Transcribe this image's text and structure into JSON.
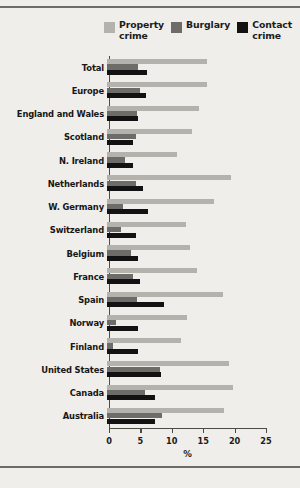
{
  "chart_data": {
    "type": "bar",
    "orientation": "horizontal",
    "title": "",
    "subtitle": "",
    "xlabel": "%",
    "ylabel": "",
    "xlim": [
      0,
      25
    ],
    "xticks": [
      0,
      5,
      10,
      15,
      20,
      25
    ],
    "grid": false,
    "legend_position": "top-right",
    "categories": [
      "Total",
      "Europe",
      "England and Wales",
      "Scotland",
      "N. Ireland",
      "Netherlands",
      "W. Germany",
      "Switzerland",
      "Belgium",
      "France",
      "Spain",
      "Norway",
      "Finland",
      "United States",
      "Canada",
      "Australia"
    ],
    "series": [
      {
        "name": "Property crime",
        "color": "#b4b2ad",
        "values": [
          16.0,
          16.0,
          14.7,
          13.6,
          11.1,
          19.7,
          17.1,
          12.5,
          13.2,
          14.4,
          18.4,
          12.7,
          11.8,
          19.5,
          20.0,
          18.7
        ]
      },
      {
        "name": "Burglary",
        "color": "#6d6c68",
        "values": [
          5.0,
          5.3,
          4.7,
          4.6,
          2.9,
          4.6,
          2.6,
          2.3,
          3.9,
          4.2,
          4.7,
          1.4,
          1.0,
          8.5,
          6.1,
          8.8
        ]
      },
      {
        "name": "Contact crime",
        "color": "#121212",
        "values": [
          6.3,
          6.2,
          5.0,
          4.1,
          4.2,
          5.7,
          6.5,
          4.6,
          5.0,
          5.2,
          9.1,
          5.0,
          5.0,
          8.6,
          7.6,
          7.7
        ]
      }
    ]
  },
  "legend": {
    "items": [
      {
        "label": "Property crime",
        "color": "#b4b2ad"
      },
      {
        "label": "Burglary",
        "color": "#6d6c68"
      },
      {
        "label": "Contact crime",
        "color": "#121212"
      }
    ]
  },
  "colors": {
    "background": "#efeeea",
    "axis": "#4d4b46",
    "rule": "#6e6c66",
    "text": "#171717"
  }
}
